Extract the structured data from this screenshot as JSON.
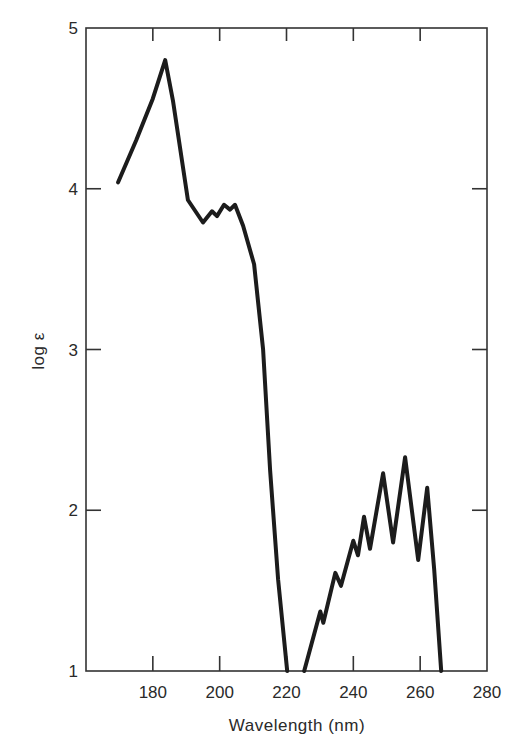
{
  "chart_data": {
    "type": "line",
    "title": "",
    "xlabel": "Wavelength (nm)",
    "ylabel": "log ε",
    "xlim": [
      160,
      280
    ],
    "ylim": [
      1,
      5
    ],
    "grid": false,
    "legend": null,
    "x_ticks": [
      180,
      200,
      220,
      240,
      260,
      280
    ],
    "x_tick_labels": [
      "180",
      "200",
      "220",
      "240",
      "260",
      "280"
    ],
    "y_ticks": [
      1,
      2,
      3,
      4,
      5
    ],
    "y_tick_labels": [
      "1",
      "2",
      "3",
      "4",
      "5"
    ],
    "series": [
      {
        "name": "absorption spectrum",
        "color": "#1c1c1c",
        "x": [
          169.6,
          175,
          180,
          183.7,
          186,
          190.5,
          195,
          197.7,
          199.2,
          201.3,
          203.1,
          204.6,
          207,
          210.3,
          213,
          215.1,
          217.5,
          220.2
        ],
        "y": [
          4.04,
          4.3,
          4.56,
          4.8,
          4.55,
          3.93,
          3.79,
          3.86,
          3.83,
          3.9,
          3.87,
          3.9,
          3.77,
          3.53,
          3.0,
          2.25,
          1.57,
          1.0
        ]
      },
      {
        "name": "absorption spectrum (long-wavelength band)",
        "color": "#1c1c1c",
        "x": [
          225.3,
          230.1,
          231,
          234.6,
          236.3,
          240,
          241.4,
          243.2,
          245,
          248.9,
          251.9,
          255.5,
          259.4,
          262.1,
          264.2,
          266.3
        ],
        "y": [
          1.0,
          1.37,
          1.3,
          1.61,
          1.53,
          1.81,
          1.72,
          1.96,
          1.76,
          2.23,
          1.8,
          2.33,
          1.69,
          2.14,
          1.63,
          1.0
        ]
      }
    ]
  },
  "axes": {
    "x_title": "Wavelength (nm)",
    "y_title": "log ε"
  }
}
